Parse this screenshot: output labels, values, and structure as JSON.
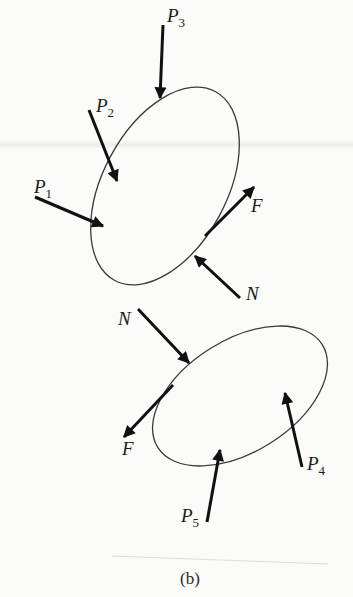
{
  "figure": {
    "caption": "(b)",
    "colors": {
      "ink": "#111111",
      "outline": "#3a3a3a",
      "paper": "#fbfbf9"
    },
    "upper_body": {
      "shape": {
        "cx": 165,
        "cy": 186,
        "rx": 107,
        "ry": 62,
        "rotation": -62
      },
      "forces": [
        {
          "id": "P3",
          "label": "P",
          "sub": "3",
          "from": [
            163,
            25
          ],
          "to": [
            160,
            98
          ],
          "label_pos": [
            167,
            22
          ]
        },
        {
          "id": "P2",
          "label": "P",
          "sub": "2",
          "from": [
            89,
            110
          ],
          "to": [
            117,
            181
          ],
          "label_pos": [
            96,
            112
          ]
        },
        {
          "id": "P1",
          "label": "P",
          "sub": "1",
          "from": [
            35,
            197
          ],
          "to": [
            103,
            226
          ],
          "label_pos": [
            34,
            193
          ]
        },
        {
          "id": "F",
          "label": "F",
          "sub": "",
          "from": [
            205,
            236
          ],
          "to": [
            254,
            187
          ],
          "label_pos": [
            251,
            212
          ]
        },
        {
          "id": "N",
          "label": "N",
          "sub": "",
          "from": [
            240,
            298
          ],
          "to": [
            195,
            256
          ],
          "label_pos": [
            246,
            300
          ]
        }
      ]
    },
    "lower_body": {
      "shape": {
        "cx": 240,
        "cy": 396,
        "rx": 97,
        "ry": 56,
        "rotation": -32
      },
      "forces": [
        {
          "id": "N",
          "label": "N",
          "sub": "",
          "from": [
            138,
            309
          ],
          "to": [
            189,
            363
          ],
          "label_pos": [
            118,
            325
          ]
        },
        {
          "id": "F",
          "label": "F",
          "sub": "",
          "from": [
            173,
            385
          ],
          "to": [
            124,
            437
          ],
          "label_pos": [
            122,
            455
          ]
        },
        {
          "id": "P5",
          "label": "P",
          "sub": "5",
          "from": [
            207,
            522
          ],
          "to": [
            220,
            450
          ],
          "label_pos": [
            181,
            522
          ]
        },
        {
          "id": "P4",
          "label": "P",
          "sub": "4",
          "from": [
            302,
            467
          ],
          "to": [
            285,
            393
          ],
          "label_pos": [
            307,
            470
          ]
        }
      ]
    }
  }
}
